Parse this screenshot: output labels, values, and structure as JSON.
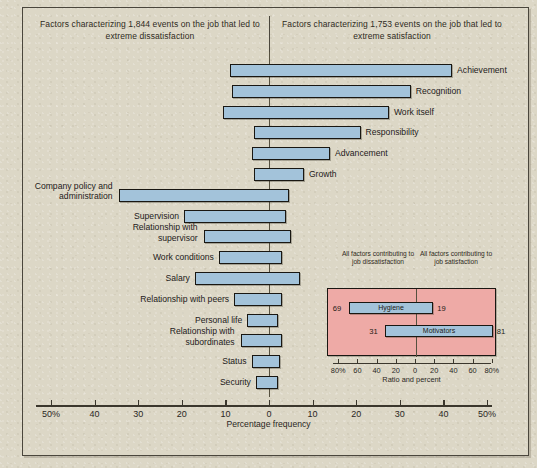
{
  "figure": {
    "header_left": "Factors characterizing 1,844 events on the job that led to extreme dissatisfaction",
    "header_right": "Factors characterizing 1,753 events on the job that led to extreme satisfaction",
    "axis_title": "Percentage frequency",
    "background_color": "#dcd7c6",
    "bar_color": "#a3c3da",
    "inset_color": "#eeaaa6"
  },
  "chart_data": {
    "type": "bar",
    "xlabel": "Percentage frequency",
    "ylabel": "",
    "xlim": [
      -50,
      50
    ],
    "grid": false,
    "legend": "none",
    "axis_ticks": [
      "50%",
      "40",
      "30",
      "20",
      "10",
      "0",
      "10",
      "20",
      "30",
      "40",
      "50%"
    ],
    "categories": [
      "Achievement",
      "Recognition",
      "Work itself",
      "Responsibility",
      "Advancement",
      "Growth",
      "Company policy and administration",
      "Supervision",
      "Relationship with supervisor",
      "Work conditions",
      "Salary",
      "Relationship with peers",
      "Personal life",
      "Relationship with subordinates",
      "Status",
      "Security"
    ],
    "series": [
      {
        "name": "Extreme dissatisfaction (left of zero)",
        "values": [
          9.0,
          8.5,
          10.5,
          3.5,
          4.0,
          3.5,
          34.5,
          19.5,
          15.0,
          11.5,
          17.0,
          8.0,
          5.0,
          6.5,
          4.0,
          3.0
        ]
      },
      {
        "name": "Extreme satisfaction (right of zero)",
        "values": [
          42.0,
          32.5,
          27.5,
          21.0,
          14.0,
          8.0,
          4.5,
          4.0,
          5.0,
          3.0,
          7.0,
          3.0,
          2.0,
          3.0,
          2.5,
          2.0
        ]
      }
    ],
    "label_side": [
      "right",
      "right",
      "right",
      "right",
      "right",
      "right",
      "left",
      "left",
      "left",
      "left",
      "left",
      "left",
      "left",
      "left",
      "left",
      "left"
    ],
    "inset": {
      "type": "bar",
      "title": "Ratio and percent",
      "caption_left": "All factors contributing to job dissatisfaction",
      "caption_right": "All factors contributing to job satisfaction",
      "axis_ticks": [
        "80%",
        "60",
        "40",
        "20",
        "0",
        "20",
        "40",
        "60",
        "80%"
      ],
      "xlim": [
        -80,
        80
      ],
      "categories": [
        "Hygiene",
        "Motivators"
      ],
      "rows": [
        {
          "label": "Hygiene",
          "left": 69,
          "right": 19
        },
        {
          "label": "Motivators",
          "left": 31,
          "right": 81
        }
      ]
    }
  }
}
